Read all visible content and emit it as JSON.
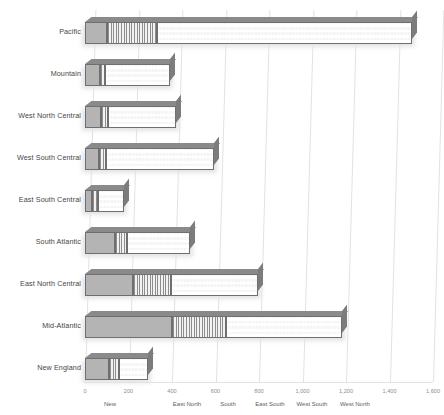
{
  "chart": {
    "type": "stacked-bar-horizontal-3d",
    "title": "",
    "xlabel": "",
    "ylabel": ""
  },
  "chart_data": {
    "type": "bar",
    "orientation": "horizontal",
    "stacked": true,
    "title": "",
    "xlabel": "",
    "ylabel": "",
    "xlim": [
      0,
      1600
    ],
    "ylim": null,
    "grid": true,
    "grid_axis": "x",
    "legend_position": "bottom",
    "categories": [
      "Pacific",
      "Mountain",
      "West North Central",
      "West South Central",
      "East South Central",
      "South Atlantic",
      "East North Central",
      "Mid-Atlantic",
      "New England"
    ],
    "series": [
      {
        "name": "New England",
        "pattern": "solid-gray",
        "values": [
          100,
          70,
          75,
          65,
          30,
          140,
          220,
          400,
          110
        ]
      },
      {
        "name": "East North",
        "pattern": "vertical-stripes",
        "values": [
          230,
          20,
          30,
          30,
          30,
          55,
          175,
          250,
          45
        ]
      },
      {
        "name": "South",
        "pattern": "checkerboard",
        "values": [
          1175,
          300,
          315,
          500,
          120,
          290,
          400,
          530,
          135
        ]
      }
    ],
    "legend_entries": [
      "New",
      "East North",
      "South",
      "East South",
      "West South",
      "West North"
    ],
    "xticks": [
      0,
      200,
      400,
      600,
      800,
      1000,
      1200,
      1400,
      1600
    ],
    "xticklabels": [
      "0",
      "200",
      "400",
      "600",
      "800",
      "1,000",
      "1,200",
      "1,400",
      "1,600"
    ],
    "totals": [
      1505,
      390,
      420,
      595,
      180,
      485,
      795,
      1180,
      290
    ]
  },
  "colors": {
    "background": "#ffffff",
    "gridline": "#e2e2e2",
    "label_text": "#464646",
    "tick_text": "#8e8e8e",
    "segment_solid": "#b4b4b4",
    "segment_stripe": "#eeeeee",
    "segment_check": "#f4f4f4",
    "bar_outline": "#6f6f6f",
    "bar_top_face": "#8a8a8a",
    "bar_side_face": "#7c7c7c"
  }
}
